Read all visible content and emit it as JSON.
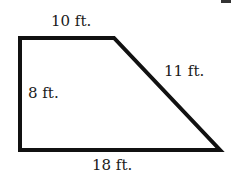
{
  "diagram": {
    "shape": "right trapezoid",
    "stroke_color": "#111111",
    "background": "#ffffff",
    "vertices": [
      [
        20,
        38
      ],
      [
        114,
        38
      ],
      [
        220,
        150
      ],
      [
        20,
        150
      ]
    ],
    "labels": {
      "top": "10 ft.",
      "left": "8 ft.",
      "slant": "11 ft.",
      "bottom": "18 ft."
    }
  }
}
